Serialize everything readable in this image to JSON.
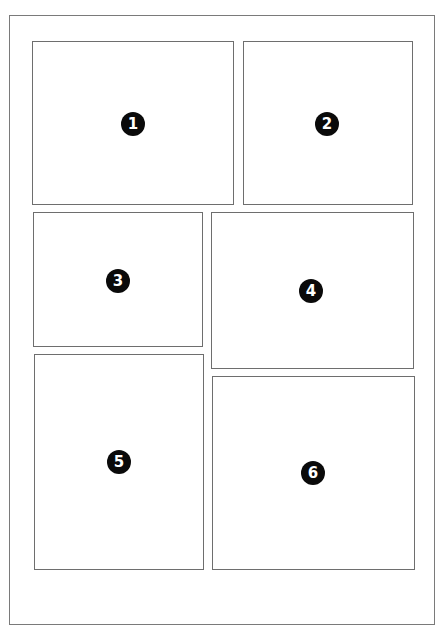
{
  "layout": {
    "frame": {
      "x": 9,
      "y": 15,
      "w": 426,
      "h": 610
    },
    "colors": {
      "border": "#6e6e6e",
      "frame_border": "#7a7a7a",
      "badge_fill": "#0a0a0a",
      "badge_text": "#ffffff",
      "background": "#ffffff"
    }
  },
  "panels": [
    {
      "label": "1",
      "x": 32,
      "y": 41,
      "w": 202,
      "h": 164,
      "badge_x": 133,
      "badge_y": 124
    },
    {
      "label": "2",
      "x": 243,
      "y": 41,
      "w": 170,
      "h": 164,
      "badge_x": 327,
      "badge_y": 124
    },
    {
      "label": "3",
      "x": 33,
      "y": 212,
      "w": 170,
      "h": 135,
      "badge_x": 118,
      "badge_y": 281
    },
    {
      "label": "4",
      "x": 211,
      "y": 212,
      "w": 203,
      "h": 157,
      "badge_x": 311,
      "badge_y": 291
    },
    {
      "label": "5",
      "x": 34,
      "y": 354,
      "w": 170,
      "h": 216,
      "badge_x": 119,
      "badge_y": 462
    },
    {
      "label": "6",
      "x": 212,
      "y": 376,
      "w": 203,
      "h": 194,
      "badge_x": 313,
      "badge_y": 473
    }
  ]
}
